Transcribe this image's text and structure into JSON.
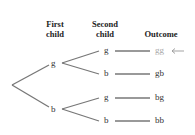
{
  "headers": {
    "first": [
      "First",
      "child"
    ],
    "second": [
      "Second",
      "child"
    ],
    "outcome": "Outcome"
  },
  "first_level": [
    "g",
    "b"
  ],
  "second_level": [
    "g",
    "b",
    "g",
    "b"
  ],
  "outcomes": [
    "gg",
    "gb",
    "bg",
    "bb"
  ],
  "highlighted_outcome_index": 0,
  "colors": {
    "line": "#777777",
    "highlight_text": "#a8a8a8",
    "arrow": "#999999"
  }
}
